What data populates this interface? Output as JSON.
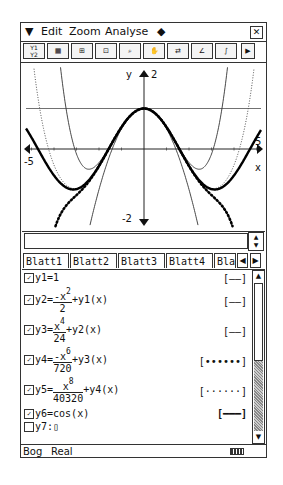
{
  "menu": {
    "dropdown_icon": "▼",
    "items": [
      "Edit",
      "Zoom",
      "Analyse"
    ],
    "diamond": "◆",
    "close": "✕"
  },
  "toolbar": {
    "buttons": [
      {
        "name": "graph-editor-button",
        "glyph": "Y1\nY2"
      },
      {
        "name": "table-button",
        "glyph": "▦"
      },
      {
        "name": "view-window-button",
        "glyph": "⊞"
      },
      {
        "name": "quick-zoom-button",
        "glyph": "⊡"
      },
      {
        "name": "zoom-box-button",
        "glyph": "🔍"
      },
      {
        "name": "pan-button",
        "glyph": "✋"
      },
      {
        "name": "trace-button",
        "glyph": "⇄"
      },
      {
        "name": "sketch-button",
        "glyph": "∠"
      },
      {
        "name": "g-solve-button",
        "glyph": "∫"
      },
      {
        "name": "more-button",
        "glyph": "▶"
      }
    ]
  },
  "graph": {
    "y_axis_label": "y",
    "x_axis_label": "x",
    "y_top_tick": "2",
    "y_bottom_tick": "-2",
    "x_left_tick": "-5",
    "x_right_tick": "5"
  },
  "chart_data": {
    "type": "line",
    "title": "",
    "xlabel": "x",
    "ylabel": "y",
    "xlim": [
      -5.2,
      5.2
    ],
    "ylim": [
      -2,
      2
    ],
    "series": [
      {
        "name": "y1",
        "formula": "1",
        "style": "thin"
      },
      {
        "name": "y2",
        "formula": "-x^2/2 + y1(x)",
        "style": "thin"
      },
      {
        "name": "y3",
        "formula": "x^4/24 + y2(x)",
        "style": "thin"
      },
      {
        "name": "y4",
        "formula": "-x^6/720 + y3(x)",
        "style": "dotted-thick"
      },
      {
        "name": "y5",
        "formula": "x^8/40320 + y4(x)",
        "style": "dotted-thin"
      },
      {
        "name": "y6",
        "formula": "cos(x)",
        "style": "thick"
      }
    ]
  },
  "input": {
    "value": ""
  },
  "tabs": {
    "items": [
      "Blatt1",
      "Blatt2",
      "Blatt3",
      "Blatt4",
      "Bla"
    ],
    "active": "Blatt1",
    "left_arrow": "◀",
    "right_arrow": "▶"
  },
  "functions": [
    {
      "checked": true,
      "label": "y1=",
      "expr": "1",
      "style": "[——]"
    },
    {
      "checked": true,
      "label": "y2=",
      "num": "-x",
      "num_exp": "2",
      "den": "2",
      "tail": "+y1(x)",
      "style": "[——]"
    },
    {
      "checked": true,
      "label": "y3=",
      "num": "x",
      "num_exp": "4",
      "den": "24",
      "tail": "+y2(x)",
      "style": "[——]"
    },
    {
      "checked": true,
      "label": "y4=",
      "num": "-x",
      "num_exp": "6",
      "den": "720",
      "tail": "+y3(x)",
      "style": "[••••••]"
    },
    {
      "checked": true,
      "label": "y5=",
      "num": "x",
      "num_exp": "8",
      "den": "40320",
      "tail": "+y4(x)",
      "style": "[······]"
    },
    {
      "checked": true,
      "label": "y6=",
      "expr": "cos(x)",
      "style": "[━━━]"
    },
    {
      "checked": false,
      "label": "y7:",
      "expr": "▯",
      "style": ""
    }
  ],
  "status": {
    "angle": "Bog",
    "mode": "Real"
  }
}
